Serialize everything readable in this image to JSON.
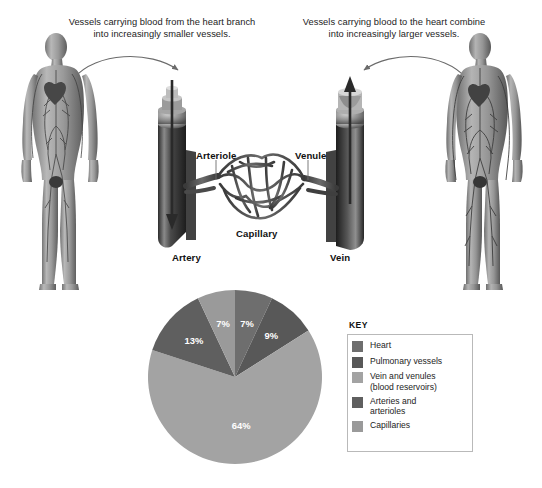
{
  "figure": {
    "background": "#ffffff",
    "captions": {
      "left": "Vessels carrying blood from the heart branch into increasingly smaller vessels.",
      "right": "Vessels carrying blood to the heart combine into increasingly larger vessels."
    },
    "vessel_labels": {
      "arteriole": "Arteriole",
      "venule": "Venule",
      "capillary": "Capillary",
      "artery": "Artery",
      "vein": "Vein"
    },
    "body_figures": {
      "left_alt": "anatomical male figure showing arterial circulation",
      "right_alt": "anatomical male figure showing venous circulation"
    },
    "arrows": {
      "left_alt": "curved arrow pointing to artery",
      "right_alt": "curved arrow pointing to vein",
      "artery_flow_alt": "downward flow arrow inside artery",
      "vein_flow_alt": "upward flow arrow inside vein"
    }
  },
  "key": {
    "title": "KEY",
    "items": [
      {
        "label": "Heart",
        "color": "#6e6e6e"
      },
      {
        "label": "Pulmonary vessels",
        "color": "#585858"
      },
      {
        "label": "Vein and venules\n(blood reservoirs)",
        "color": "#a3a3a3"
      },
      {
        "label": "Arteries and\narterioles",
        "color": "#5f5f5f"
      },
      {
        "label": "Capillaries",
        "color": "#9a9a9a"
      }
    ]
  },
  "chart_data": {
    "type": "pie",
    "title": "",
    "labels": [
      "Heart",
      "Pulmonary vessels",
      "Vein and venules (blood reservoirs)",
      "Arteries and arterioles",
      "Capillaries"
    ],
    "values": [
      7,
      9,
      64,
      13,
      7
    ],
    "display_labels": [
      "7%",
      "9%",
      "64%",
      "13%",
      "7%"
    ],
    "colors": [
      "#6e6e6e",
      "#585858",
      "#a3a3a3",
      "#5f5f5f",
      "#9a9a9a"
    ],
    "start_angle_deg": 0,
    "direction": "clockwise",
    "legend_position": "right",
    "grid": false,
    "units": "percent of total blood volume"
  }
}
